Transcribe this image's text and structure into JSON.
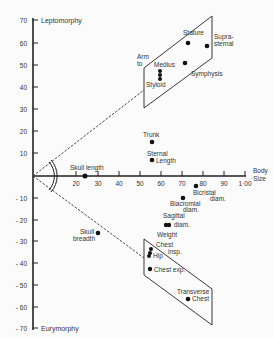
{
  "chart_data": {
    "type": "scatter",
    "title": "",
    "xlabel": "Body Size",
    "ylabel": "",
    "y_top_label": "Leptomorphy",
    "y_bottom_label": "Eurymorphy",
    "xlim": [
      0,
      100
    ],
    "ylim": [
      -70,
      70
    ],
    "x_ticks": [
      "20",
      "30",
      "40",
      "50",
      "60",
      "70",
      "80",
      "90",
      "1·00"
    ],
    "y_ticks": [
      "70",
      "60",
      "50",
      "40",
      "30",
      "20",
      "10",
      "-10",
      "-20",
      "-30",
      "-40",
      "-50",
      "-60",
      "-70"
    ],
    "grid": false,
    "points": [
      {
        "label": "Stature",
        "x": 73,
        "y": 60
      },
      {
        "label": "Supra-sternal",
        "x": 82,
        "y": 59
      },
      {
        "label": "Symphysis",
        "x": 72,
        "y": 51
      },
      {
        "label": "Medius",
        "x": 60,
        "y": 48
      },
      {
        "label": "Arm to Medius",
        "x": 60,
        "y": 46
      },
      {
        "label": "Styloid",
        "x": 60,
        "y": 44
      },
      {
        "label": "Trunk",
        "x": 56,
        "y": 15
      },
      {
        "label": "Sternal Length",
        "x": 56,
        "y": 7
      },
      {
        "label": "Skull length",
        "x": 24.5,
        "y": 0
      },
      {
        "label": "Bicristal diam.",
        "x": 77,
        "y": -5
      },
      {
        "label": "Biacromial diam.",
        "x": 71,
        "y": -10
      },
      {
        "label": "Sagittal diam.",
        "x": 63,
        "y": -22
      },
      {
        "label": "Weight",
        "x": 64,
        "y": -22
      },
      {
        "label": "Chest insp.",
        "x": 55,
        "y": -34
      },
      {
        "label": "Hip",
        "x": 55,
        "y": -36
      },
      {
        "label": "Chest exp.",
        "x": 55,
        "y": -43
      },
      {
        "label": "Transverse Chest",
        "x": 73,
        "y": -56
      },
      {
        "label": "Skull breadth",
        "x": 31,
        "y": -26
      }
    ],
    "annotations": [
      "Arm to",
      "Medius",
      "Styloid",
      "Stature",
      "Supra-sternal",
      "Symphysis",
      "Trunk",
      "Sternal Length",
      "Skull length",
      "Bicristal diam.",
      "Biacromial diam.",
      "Sagittal diam.",
      "Weight",
      "Chest insp.",
      "Hip",
      "Chest exp.",
      "Transverse Chest",
      "Skull breadth"
    ]
  },
  "labels": {
    "lepto": "Leptomorphy",
    "eury": "Eurymorphy",
    "body": "Body",
    "size": "·Size",
    "arm": "Arm",
    "to": "to",
    "medius": "Medius",
    "styloid": "Styloid",
    "stature": "Stature",
    "supra1": "Supra-",
    "supra2": "sternal",
    "symphysis": "Symphysis",
    "trunk": "Trunk",
    "sternal": "Sternal",
    "length": "Length",
    "skull_length": "Skull length",
    "bicristal": "Bicristal",
    "bicristal_diam": "diam.",
    "biacromial": "Biacromial",
    "biacromial_diam": "diam.",
    "sagittal": "Sagittal",
    "sagittal_diam": "diam.",
    "weight": "Weight",
    "chest": "Chest",
    "insp": "insp.",
    "hip": "Hip",
    "chest_exp": "Chest exp.",
    "transverse": "Transverse",
    "transverse_chest": "Chest",
    "skull": "Skull",
    "breadth": "breadth"
  },
  "yticks": [
    {
      "t": "70",
      "y": 20
    },
    {
      "t": "60",
      "y": 43
    },
    {
      "t": "50",
      "y": 65
    },
    {
      "t": "40",
      "y": 87
    },
    {
      "t": "30",
      "y": 109
    },
    {
      "t": "20",
      "y": 131
    },
    {
      "t": "10",
      "y": 153
    },
    {
      "t": "- 10",
      "y": 198
    },
    {
      "t": "- 20",
      "y": 220
    },
    {
      "t": "- 30",
      "y": 241
    },
    {
      "t": "- 40",
      "y": 263
    },
    {
      "t": "- 50",
      "y": 285
    },
    {
      "t": "- 60",
      "y": 307
    },
    {
      "t": "- 70",
      "y": 328
    }
  ],
  "xticks": [
    {
      "t": "20",
      "x": 76
    },
    {
      "t": "30",
      "x": 98
    },
    {
      "t": "40",
      "x": 119
    },
    {
      "t": "50",
      "x": 140
    },
    {
      "t": "60",
      "x": 161
    },
    {
      "t": "70",
      "x": 182
    },
    {
      "t": "80",
      "x": 203
    },
    {
      "t": "90",
      "x": 224
    },
    {
      "t": "1·00",
      "x": 245
    }
  ]
}
